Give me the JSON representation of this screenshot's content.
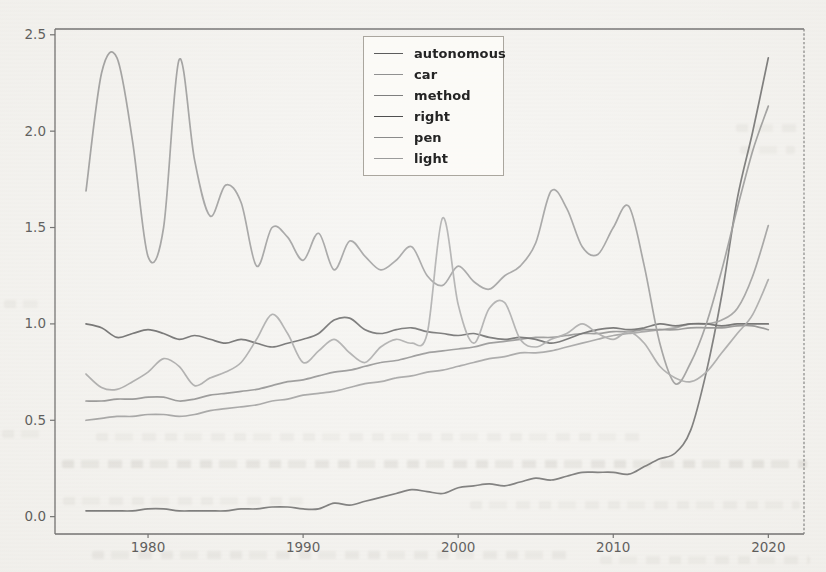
{
  "page": {
    "background_color": "#f5f4f1"
  },
  "chart_data": {
    "type": "line",
    "title": "",
    "xlabel": "",
    "ylabel": "",
    "grid": false,
    "legend_position": "upper center",
    "xlim": [
      1974.0,
      2022.3
    ],
    "ylim": [
      -0.09,
      2.53
    ],
    "xticks": [
      "1980",
      "1990",
      "2000",
      "2010",
      "2020"
    ],
    "yticks": [
      "0.0",
      "0.5",
      "1.0",
      "1.5",
      "2.0",
      "2.5"
    ],
    "axis_color": "#565656",
    "tick_label_color": "#3d3d3d",
    "x": [
      1976,
      1977,
      1978,
      1979,
      1980,
      1981,
      1982,
      1983,
      1984,
      1985,
      1986,
      1987,
      1988,
      1989,
      1990,
      1991,
      1992,
      1993,
      1994,
      1995,
      1996,
      1997,
      1998,
      1999,
      2000,
      2001,
      2002,
      2003,
      2004,
      2005,
      2006,
      2007,
      2008,
      2009,
      2010,
      2011,
      2012,
      2013,
      2014,
      2015,
      2016,
      2017,
      2018,
      2019,
      2020
    ],
    "series": [
      {
        "name": "autonomous",
        "color": "#5c5c5c",
        "values": [
          0.03,
          0.03,
          0.03,
          0.03,
          0.04,
          0.04,
          0.03,
          0.03,
          0.03,
          0.03,
          0.04,
          0.04,
          0.05,
          0.05,
          0.04,
          0.04,
          0.07,
          0.06,
          0.08,
          0.1,
          0.12,
          0.14,
          0.13,
          0.12,
          0.15,
          0.16,
          0.17,
          0.16,
          0.18,
          0.2,
          0.19,
          0.21,
          0.23,
          0.23,
          0.23,
          0.22,
          0.26,
          0.3,
          0.33,
          0.45,
          0.75,
          1.15,
          1.65,
          2.0,
          2.38
        ]
      },
      {
        "name": "car",
        "color": "#909090",
        "values": [
          0.5,
          0.51,
          0.52,
          0.52,
          0.53,
          0.53,
          0.52,
          0.53,
          0.55,
          0.56,
          0.57,
          0.58,
          0.6,
          0.61,
          0.63,
          0.64,
          0.65,
          0.67,
          0.69,
          0.7,
          0.72,
          0.73,
          0.75,
          0.76,
          0.78,
          0.8,
          0.82,
          0.83,
          0.85,
          0.85,
          0.86,
          0.88,
          0.9,
          0.92,
          0.94,
          0.95,
          0.96,
          0.97,
          0.98,
          1.0,
          1.0,
          1.02,
          1.08,
          1.25,
          1.51
        ]
      },
      {
        "name": "method",
        "color": "#7e7e7e",
        "values": [
          0.6,
          0.6,
          0.61,
          0.61,
          0.62,
          0.62,
          0.6,
          0.61,
          0.63,
          0.64,
          0.65,
          0.66,
          0.68,
          0.7,
          0.71,
          0.73,
          0.75,
          0.76,
          0.78,
          0.8,
          0.81,
          0.83,
          0.85,
          0.86,
          0.87,
          0.88,
          0.9,
          0.91,
          0.92,
          0.93,
          0.93,
          0.94,
          0.95,
          0.95,
          0.96,
          0.96,
          0.97,
          0.97,
          0.97,
          0.98,
          0.98,
          0.98,
          0.99,
          0.99,
          0.97
        ]
      },
      {
        "name": "right",
        "color": "#4f4f4f",
        "values": [
          1.0,
          0.98,
          0.93,
          0.95,
          0.97,
          0.95,
          0.92,
          0.94,
          0.92,
          0.9,
          0.92,
          0.9,
          0.88,
          0.9,
          0.92,
          0.95,
          1.02,
          1.03,
          0.97,
          0.95,
          0.97,
          0.98,
          0.96,
          0.95,
          0.94,
          0.95,
          0.93,
          0.92,
          0.93,
          0.92,
          0.9,
          0.92,
          0.95,
          0.97,
          0.98,
          0.97,
          0.98,
          1.0,
          0.99,
          1.0,
          1.0,
          0.99,
          1.0,
          1.0,
          1.0
        ]
      },
      {
        "name": "pen",
        "color": "#8b8b8b",
        "values": [
          1.69,
          2.3,
          2.38,
          1.95,
          1.35,
          1.5,
          2.37,
          1.85,
          1.56,
          1.72,
          1.63,
          1.3,
          1.5,
          1.45,
          1.33,
          1.47,
          1.28,
          1.43,
          1.35,
          1.28,
          1.33,
          1.4,
          1.25,
          1.2,
          1.3,
          1.22,
          1.18,
          1.25,
          1.3,
          1.42,
          1.69,
          1.6,
          1.4,
          1.36,
          1.5,
          1.61,
          1.3,
          0.9,
          0.69,
          0.8,
          1.0,
          1.28,
          1.6,
          1.9,
          2.13
        ]
      },
      {
        "name": "light",
        "color": "#9b9b9b",
        "values": [
          0.74,
          0.67,
          0.66,
          0.7,
          0.75,
          0.82,
          0.78,
          0.68,
          0.72,
          0.75,
          0.8,
          0.92,
          1.05,
          0.95,
          0.8,
          0.86,
          0.92,
          0.85,
          0.8,
          0.88,
          0.92,
          0.9,
          0.95,
          1.55,
          1.1,
          0.9,
          1.08,
          1.11,
          0.92,
          0.88,
          0.92,
          0.95,
          1.0,
          0.95,
          0.92,
          0.96,
          0.9,
          0.78,
          0.72,
          0.7,
          0.75,
          0.85,
          0.95,
          1.05,
          1.23
        ]
      }
    ]
  }
}
